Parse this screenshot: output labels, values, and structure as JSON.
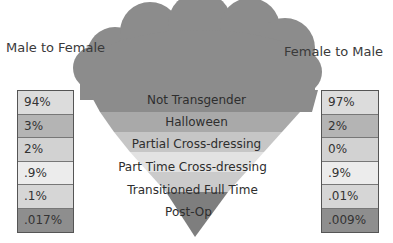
{
  "titles": {
    "left": "Male to Female",
    "right": "Female to Male"
  },
  "funnel": {
    "stages": [
      {
        "label": "Not Transgender",
        "color": "#8c8c8c"
      },
      {
        "label": "Halloween",
        "color": "#a9a9a9"
      },
      {
        "label": "Partial Cross-dressing",
        "color": "#c6c6c6"
      },
      {
        "label": "Part Time Cross-dressing",
        "color": "#e2e2e2"
      },
      {
        "label": "Transitioned Full Time",
        "color": "#cbcbcb"
      },
      {
        "label": "Post-Op",
        "color": "#7e7e7e"
      }
    ],
    "cloud_color": "#8c8c8c"
  },
  "left_values": [
    {
      "value": "94%",
      "color": "#dcdcdc"
    },
    {
      "value": "3%",
      "color": "#b4b4b4"
    },
    {
      "value": "2%",
      "color": "#d2d2d2"
    },
    {
      "value": ".9%",
      "color": "#ececec"
    },
    {
      "value": ".1%",
      "color": "#d6d6d6"
    },
    {
      "value": ".017%",
      "color": "#8e8e8e"
    }
  ],
  "right_values": [
    {
      "value": "97%",
      "color": "#dcdcdc"
    },
    {
      "value": "2%",
      "color": "#b4b4b4"
    },
    {
      "value": "0%",
      "color": "#d2d2d2"
    },
    {
      "value": ".9%",
      "color": "#ececec"
    },
    {
      "value": ".01%",
      "color": "#d6d6d6"
    },
    {
      "value": ".009%",
      "color": "#8e8e8e"
    }
  ]
}
